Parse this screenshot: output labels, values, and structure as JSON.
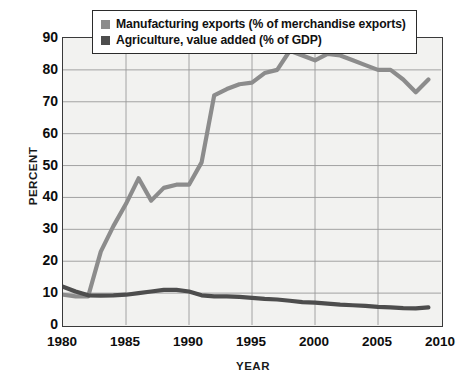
{
  "chart_data": {
    "type": "line",
    "title": "",
    "xlabel": "YEAR",
    "ylabel": "PERCENT",
    "xlim": [
      1980,
      2010
    ],
    "ylim": [
      0,
      90
    ],
    "xticks": [
      1980,
      1985,
      1990,
      1995,
      2000,
      2005,
      2010
    ],
    "yticks": [
      0,
      10,
      20,
      30,
      40,
      50,
      60,
      70,
      80,
      90
    ],
    "grid": true,
    "legend_position": "top-center",
    "x": [
      1980,
      1981,
      1982,
      1983,
      1984,
      1985,
      1986,
      1987,
      1988,
      1989,
      1990,
      1991,
      1992,
      1993,
      1994,
      1995,
      1996,
      1997,
      1998,
      1999,
      2000,
      2001,
      2002,
      2003,
      2004,
      2005,
      2006,
      2007,
      2008,
      2009
    ],
    "series": [
      {
        "name": "Manufacturing exports (% of merchandise exports)",
        "color": "#8c8c8c",
        "values": [
          9.5,
          9.0,
          9.0,
          23.0,
          31.0,
          38.0,
          46.0,
          39.0,
          43.0,
          44.0,
          44.0,
          51.0,
          72.0,
          74.0,
          75.5,
          76.0,
          79.0,
          80.0,
          86.0,
          84.5,
          83.0,
          85.0,
          84.5,
          83.0,
          81.5,
          80.0,
          80.0,
          77.0,
          73.0,
          77.0
        ]
      },
      {
        "name": "Agriculture, value added (% of GDP)",
        "color": "#4d4d4d",
        "values": [
          12.0,
          10.5,
          9.3,
          9.2,
          9.3,
          9.5,
          10.0,
          10.5,
          11.0,
          11.0,
          10.5,
          9.3,
          9.0,
          9.0,
          8.8,
          8.5,
          8.2,
          8.0,
          7.6,
          7.2,
          7.0,
          6.7,
          6.4,
          6.2,
          6.0,
          5.7,
          5.5,
          5.3,
          5.2,
          5.5
        ]
      }
    ]
  },
  "legend": {
    "items": [
      {
        "label": "Manufacturing exports (% of merchandise exports)",
        "color": "#8c8c8c"
      },
      {
        "label": "Agriculture, value added (% of GDP)",
        "color": "#4d4d4d"
      }
    ]
  },
  "axes": {
    "y_title": "PERCENT",
    "x_title": "YEAR",
    "y_tick_labels": [
      "90",
      "80",
      "70",
      "60",
      "50",
      "40",
      "30",
      "20",
      "10",
      "0"
    ],
    "x_tick_labels": [
      "1980",
      "1985",
      "1990",
      "1995",
      "2000",
      "2005",
      "2010"
    ]
  }
}
